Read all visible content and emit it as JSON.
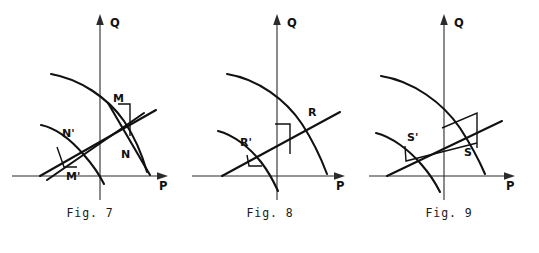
{
  "sheet": {
    "background_color": "#ffffff",
    "ink_color": "#111111",
    "panel_count": 3
  },
  "figures": [
    {
      "id": "fig7",
      "caption": "Fig. 7",
      "axes": {
        "x_label": "P",
        "y_label": "Q"
      },
      "point_labels": [
        "M",
        "N",
        "N'",
        "M'"
      ],
      "curves": [
        {
          "name": "concave-arc",
          "kind": "arc"
        },
        {
          "name": "lower-arc",
          "kind": "arc"
        },
        {
          "name": "budget-line-upper",
          "kind": "line"
        },
        {
          "name": "budget-line-lower",
          "kind": "line"
        },
        {
          "name": "steep-line",
          "kind": "line"
        }
      ],
      "markers": [
        "angle-marker-MN",
        "angle-marker-M-prime"
      ]
    },
    {
      "id": "fig8",
      "caption": "Fig. 8",
      "axes": {
        "x_label": "P",
        "y_label": "Q"
      },
      "point_labels": [
        "R",
        "R'"
      ],
      "curves": [
        {
          "name": "concave-arc",
          "kind": "arc"
        },
        {
          "name": "lower-arc",
          "kind": "arc"
        },
        {
          "name": "budget-line",
          "kind": "line"
        },
        {
          "name": "steep-line",
          "kind": "line"
        }
      ],
      "markers": [
        "angle-marker-R",
        "angle-marker-R-prime"
      ]
    },
    {
      "id": "fig9",
      "caption": "Fig. 9",
      "axes": {
        "x_label": "P",
        "y_label": "Q"
      },
      "point_labels": [
        "S",
        "S'"
      ],
      "curves": [
        {
          "name": "concave-arc",
          "kind": "arc"
        },
        {
          "name": "lower-arc",
          "kind": "arc"
        },
        {
          "name": "budget-line",
          "kind": "line"
        },
        {
          "name": "steep-line",
          "kind": "line"
        }
      ],
      "markers": [
        "angle-marker-S",
        "angle-marker-S-prime"
      ]
    }
  ],
  "labels": {
    "fig7": {
      "caption": "Fig. 7",
      "axis_x": "P",
      "axis_y": "Q",
      "p1": "M",
      "p2": "N",
      "p3": "N'",
      "p4": "M'"
    },
    "fig8": {
      "caption": "Fig. 8",
      "axis_x": "P",
      "axis_y": "Q",
      "p1": "R",
      "p2": "R'"
    },
    "fig9": {
      "caption": "Fig. 9",
      "axis_x": "P",
      "axis_y": "Q",
      "p1": "S",
      "p2": "S'"
    }
  }
}
